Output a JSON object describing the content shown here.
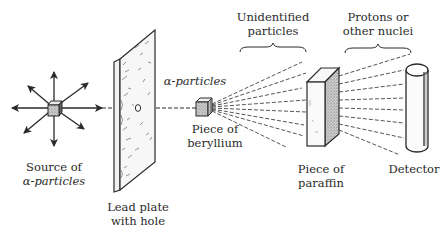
{
  "diagram": {
    "title": "",
    "labels": {
      "source_line1": "Source of",
      "source_line2": "α-particles",
      "lead_line1": "Lead plate",
      "lead_line2": "with hole",
      "alpha_beam": "α-particles",
      "beryllium_line1": "Piece of",
      "beryllium_line2": "beryllium",
      "unidentified_line1": "Unidentified",
      "unidentified_line2": "particles",
      "protons_line1": "Protons or",
      "protons_line2": "other nuclei",
      "paraffin_line1": "Piece of",
      "paraffin_line2": "paraffin",
      "detector": "Detector"
    },
    "components": [
      {
        "id": "source",
        "name": "Source of α-particles",
        "shape": "cube with 8 radiating arrows"
      },
      {
        "id": "lead_plate",
        "name": "Lead plate with hole",
        "shape": "tilted plate with small hole"
      },
      {
        "id": "beryllium",
        "name": "Piece of beryllium",
        "shape": "small cube"
      },
      {
        "id": "paraffin",
        "name": "Piece of paraffin",
        "shape": "rectangular block"
      },
      {
        "id": "detector",
        "name": "Detector",
        "shape": "vertical cylinder"
      }
    ],
    "flows": [
      {
        "from": "source",
        "to": "beryllium",
        "label": "α-particles",
        "style": "dashed",
        "via": "lead_plate hole"
      },
      {
        "from": "beryllium",
        "to": "paraffin",
        "label": "Unidentified particles",
        "style": "dashed fan"
      },
      {
        "from": "paraffin",
        "to": "detector",
        "label": "Protons or other nuclei",
        "style": "dashed fan"
      }
    ],
    "colors": {
      "ink": "#2a2a2a",
      "background": "#ffffff",
      "shading": "#8a8a8a"
    }
  }
}
